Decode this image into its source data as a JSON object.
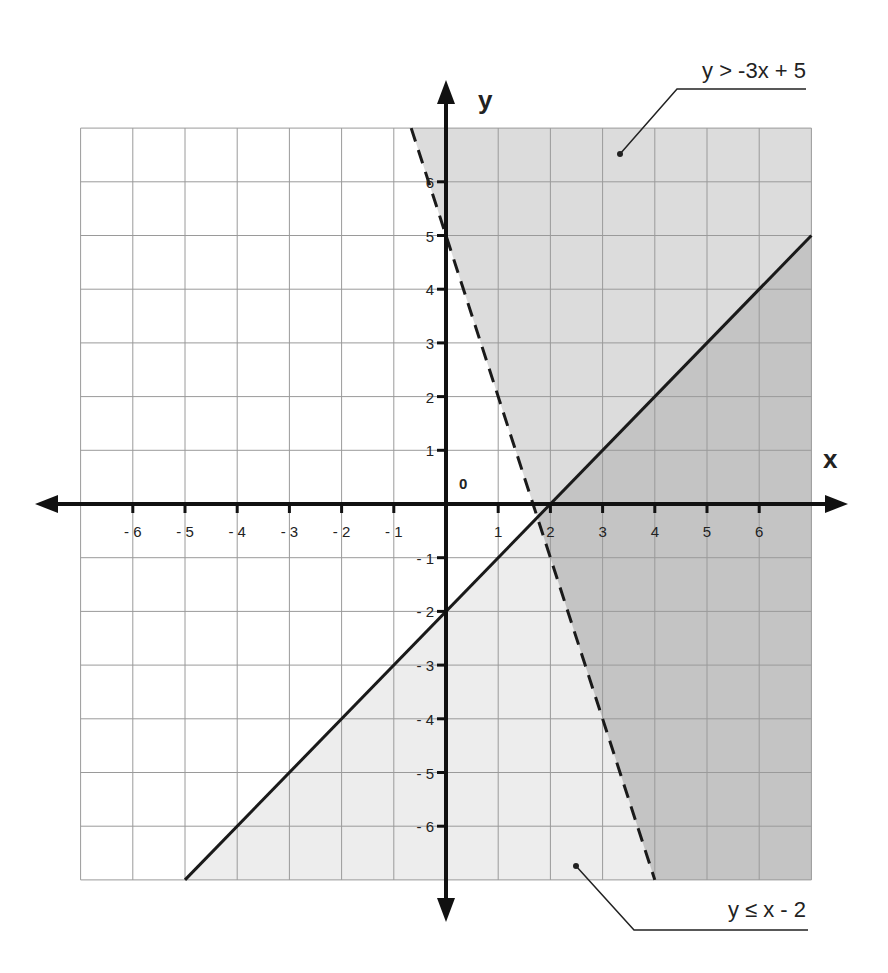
{
  "chart_data": {
    "type": "area",
    "title": "",
    "xlabel": "x",
    "ylabel": "y",
    "origin_label": "0",
    "xlim": [
      -7,
      7
    ],
    "ylim": [
      -7,
      7
    ],
    "grid": true,
    "x_ticks": [
      -6,
      -5,
      -4,
      -3,
      -2,
      -1,
      1,
      2,
      3,
      4,
      5,
      6
    ],
    "y_ticks": [
      -6,
      -5,
      -4,
      -3,
      -2,
      -1,
      1,
      2,
      3,
      4,
      5,
      6
    ],
    "x_tick_labels": [
      "- 6",
      "- 5",
      "- 4",
      "- 3",
      "- 2",
      "- 1",
      "1",
      "2",
      "3",
      "4",
      "5",
      "6"
    ],
    "y_tick_labels": [
      "- 6",
      "- 5",
      "- 4",
      "- 3",
      "- 2",
      "- 1",
      "1",
      "2",
      "3",
      "4",
      "5",
      "6"
    ],
    "series": [
      {
        "name": "y > -3x + 5",
        "boundary": {
          "slope": -3,
          "intercept": 5,
          "style": "dashed"
        },
        "shade": "above",
        "fill": "#dcdcdc",
        "points": [
          [
            -0.667,
            7
          ],
          [
            4,
            -7
          ]
        ]
      },
      {
        "name": "y ≤ x - 2",
        "boundary": {
          "slope": 1,
          "intercept": -2,
          "style": "solid"
        },
        "shade": "below",
        "fill": "#ededed",
        "points": [
          [
            -5,
            -7
          ],
          [
            7,
            5
          ]
        ]
      }
    ],
    "overlap_fill": "#c4c4c4",
    "annotations": [
      {
        "text": "y > -3x + 5",
        "position": "top-right",
        "pointer_to": [
          3.3,
          6.5
        ]
      },
      {
        "text": "y ≤ x - 2",
        "position": "bottom-right",
        "pointer_to": [
          2.5,
          -6.7
        ]
      }
    ],
    "intersection": [
      1.75,
      -0.25
    ]
  },
  "labels": {
    "x_axis": "x",
    "y_axis": "y",
    "origin": "0",
    "ineq1": "y > -3x + 5",
    "ineq2": "y ≤ x - 2"
  }
}
